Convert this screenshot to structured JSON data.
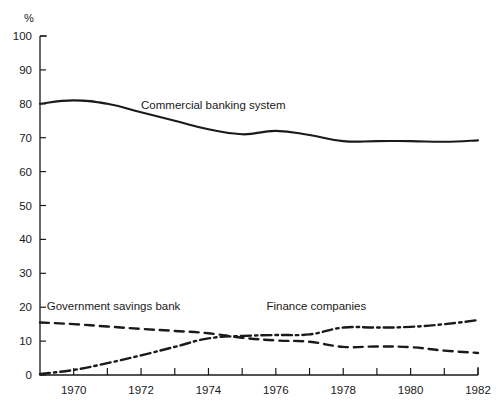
{
  "chart_data": {
    "type": "line",
    "title": "",
    "xlabel": "",
    "ylabel": "%",
    "ylim": [
      0,
      100
    ],
    "xlim": [
      1969,
      1982
    ],
    "grid": false,
    "legend_position": "inline-annotations",
    "ytick_labels": [
      "0",
      "10",
      "20",
      "30",
      "40",
      "50",
      "60",
      "70",
      "80",
      "90",
      "100"
    ],
    "ytick_values": [
      0,
      10,
      20,
      30,
      40,
      50,
      60,
      70,
      80,
      90,
      100
    ],
    "xtick_values": [
      1969,
      1970,
      1971,
      1972,
      1973,
      1974,
      1975,
      1976,
      1977,
      1978,
      1979,
      1980,
      1981,
      1982
    ],
    "xtick_labels": [
      "",
      "1970",
      "",
      "1972",
      "",
      "1974",
      "",
      "1976",
      "",
      "1978",
      "",
      "1980",
      "",
      "1982"
    ],
    "x": [
      1969,
      1970,
      1971,
      1972,
      1973,
      1974,
      1975,
      1976,
      1977,
      1978,
      1979,
      1980,
      1981,
      1982
    ],
    "series": [
      {
        "name": "Commercial banking system",
        "style": "solid",
        "color": "#1a1a1a",
        "values": [
          80.0,
          81.0,
          80.0,
          77.5,
          75.0,
          72.5,
          71.0,
          72.0,
          70.8,
          69.0,
          69.0,
          69.0,
          68.8,
          69.2
        ],
        "label_x": 1972.0,
        "label_y": 78.5
      },
      {
        "name": "Government savings bank",
        "style": "dashed",
        "color": "#1a1a1a",
        "values": [
          15.5,
          15.0,
          14.3,
          13.6,
          13.0,
          12.3,
          11.0,
          10.2,
          9.8,
          8.3,
          8.4,
          8.2,
          7.2,
          6.5
        ],
        "label_x": 1969.2,
        "label_y": 19.2
      },
      {
        "name": "Finance companies",
        "style": "dashdot",
        "color": "#1a1a1a",
        "values": [
          0.3,
          1.5,
          3.5,
          5.8,
          8.3,
          10.8,
          11.5,
          11.8,
          12.0,
          14.0,
          14.0,
          14.2,
          15.0,
          16.2
        ],
        "label_x": 1977.2,
        "label_y": 19.2
      }
    ]
  }
}
